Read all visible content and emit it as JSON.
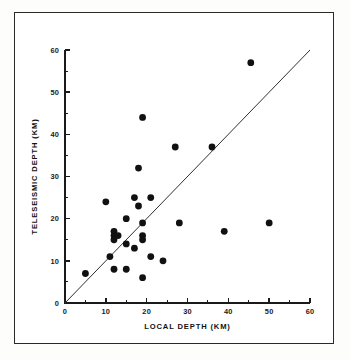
{
  "figure": {
    "frame_color": "#2a2a2a",
    "background_color": "#ffffff",
    "point_color": "#111111",
    "line_color": "#303030"
  },
  "chart_data": {
    "type": "scatter",
    "title": "",
    "subtitle": "",
    "xlabel": "LOCAL DEPTH (KM)",
    "ylabel": "TELESEISMIC DEPTH (KM)",
    "xlim": [
      0,
      60
    ],
    "ylim": [
      0,
      60
    ],
    "xticks": [
      0,
      10,
      20,
      30,
      40,
      50,
      60
    ],
    "yticks": [
      0,
      10,
      20,
      30,
      40,
      50,
      60
    ],
    "xtick_labels": [
      "0",
      "10",
      "20",
      "30",
      "40",
      "50",
      "60"
    ],
    "ytick_labels": [
      "0",
      "10",
      "20",
      "30",
      "40",
      "50",
      "60"
    ],
    "minor_tick_interval": 5,
    "grid": false,
    "legend": null,
    "legend_position": "none",
    "marker": "filled-circle",
    "marker_size_px": 3.4,
    "annotations": [
      {
        "name": "one-to-one-reference-line",
        "type": "line",
        "x": [
          0,
          60
        ],
        "y": [
          0,
          60
        ],
        "description": "1:1 diagonal reference line"
      }
    ],
    "points": [
      {
        "x": 5,
        "y": 7
      },
      {
        "x": 10,
        "y": 24
      },
      {
        "x": 11,
        "y": 11
      },
      {
        "x": 12,
        "y": 17
      },
      {
        "x": 12,
        "y": 16
      },
      {
        "x": 12,
        "y": 15
      },
      {
        "x": 12,
        "y": 8
      },
      {
        "x": 13,
        "y": 16
      },
      {
        "x": 15,
        "y": 20
      },
      {
        "x": 15,
        "y": 14
      },
      {
        "x": 15,
        "y": 8
      },
      {
        "x": 17,
        "y": 25
      },
      {
        "x": 17,
        "y": 13
      },
      {
        "x": 18,
        "y": 23
      },
      {
        "x": 18,
        "y": 32
      },
      {
        "x": 19,
        "y": 44
      },
      {
        "x": 19,
        "y": 19
      },
      {
        "x": 19,
        "y": 16
      },
      {
        "x": 19,
        "y": 15
      },
      {
        "x": 19,
        "y": 6
      },
      {
        "x": 21,
        "y": 25
      },
      {
        "x": 21,
        "y": 11
      },
      {
        "x": 24,
        "y": 10
      },
      {
        "x": 27,
        "y": 37
      },
      {
        "x": 28,
        "y": 19
      },
      {
        "x": 36,
        "y": 37
      },
      {
        "x": 39,
        "y": 17
      },
      {
        "x": 45.5,
        "y": 57
      },
      {
        "x": 50,
        "y": 19
      }
    ],
    "n_points": 29
  }
}
